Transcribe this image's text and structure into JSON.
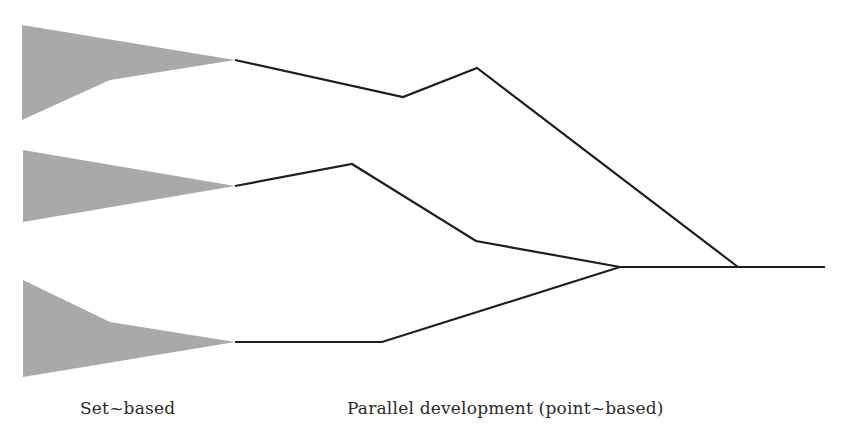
{
  "labels": {
    "set_based": "Set~based",
    "parallel": "Parallel development (point~based)"
  },
  "colors": {
    "fan_fill": "#a9a9a9",
    "line": "#1e1e1e",
    "background": "#ffffff"
  },
  "shapes": {
    "fans": [
      {
        "name": "top",
        "points": "22,25 235,60 110,80 22,120"
      },
      {
        "name": "middle",
        "points": "23,150 235,186 23,222"
      },
      {
        "name": "bottom",
        "points": "23,280 110,322 235,342 23,377"
      }
    ],
    "paths": [
      {
        "name": "top",
        "points": "235,60 403,97 477,68 738,267"
      },
      {
        "name": "middle",
        "points": "235,186 352,164 476,241 620,267"
      },
      {
        "name": "bottom",
        "points": "235,342 382,342 620,267"
      },
      {
        "name": "converged",
        "points": "620,267 825,267"
      }
    ]
  }
}
